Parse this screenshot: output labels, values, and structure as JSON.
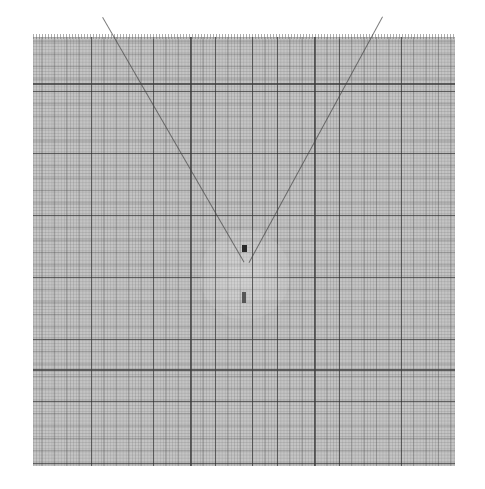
{
  "image": {
    "description": "Scanned sheet of millimeter graph paper with faint V-shaped diagonal lines converging near center",
    "paper_color": "#c4c4c4",
    "major_line_color": "#3a3a3a",
    "background_color": "#ffffff",
    "sheet_bounds": {
      "left": 33,
      "top": 37,
      "right": 455,
      "bottom": 466
    }
  },
  "major_lines": {
    "horizontal_y": [
      84,
      370
    ],
    "vertical_x": [
      191,
      253,
      315
    ]
  },
  "diagonals": [
    {
      "from": [
        103,
        17
      ],
      "to": [
        244,
        262
      ]
    },
    {
      "from": [
        383,
        17
      ],
      "to": [
        250,
        262
      ]
    }
  ],
  "marks": [
    {
      "x": 242,
      "y": 245,
      "w": 5,
      "h": 7
    },
    {
      "x": 242,
      "y": 292,
      "w": 4,
      "h": 11
    }
  ]
}
